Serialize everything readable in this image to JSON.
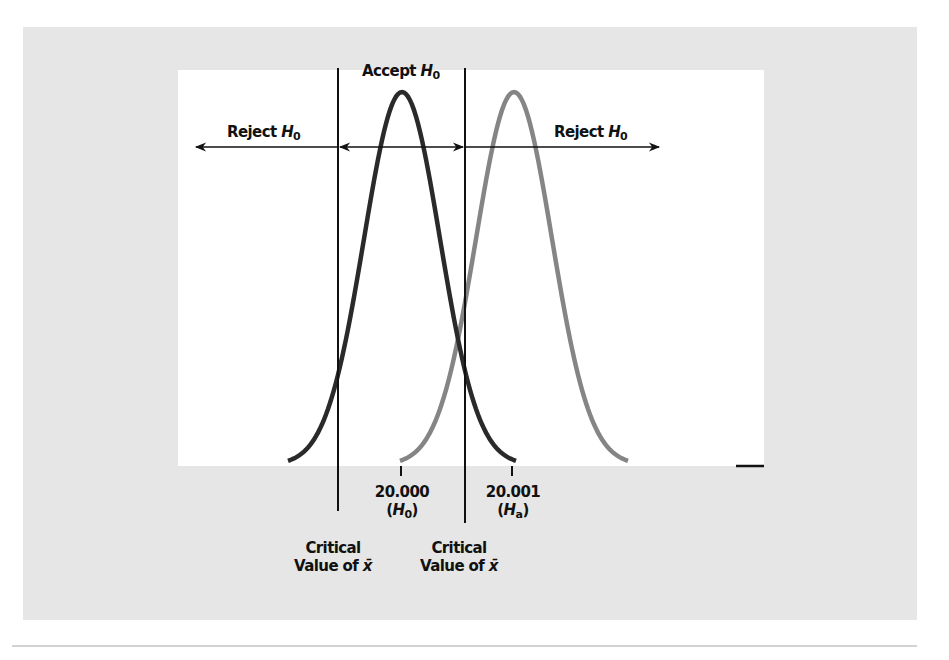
{
  "figure": {
    "labels": {
      "accept": {
        "prefix": "Accept ",
        "symbol": "H",
        "subscript": "0"
      },
      "reject_left": {
        "prefix": "Reject ",
        "symbol": "H",
        "subscript": "0"
      },
      "reject_right": {
        "prefix": "Reject ",
        "symbol": "H",
        "subscript": "0"
      }
    },
    "ticks": [
      {
        "value": "20.000",
        "hyp_symbol": "H",
        "hyp_subscript": "0"
      },
      {
        "value": "20.001",
        "hyp_symbol": "H",
        "hyp_subscript": "a"
      }
    ],
    "critical_labels": [
      {
        "line1": "Critical",
        "line2_prefix": "Value of ",
        "line2_symbol": "x̄"
      },
      {
        "line1": "Critical",
        "line2_prefix": "Value of ",
        "line2_symbol": "x̄"
      }
    ],
    "colors": {
      "background_panel": "#e6e6e6",
      "plot_area": "#ffffff",
      "h0_curve": "#2a2a2a",
      "ha_curve": "#858585",
      "lines": "#111111"
    }
  },
  "chart_data": {
    "type": "line",
    "title": "",
    "xlabel": "",
    "ylabel": "",
    "series": [
      {
        "name": "Distribution under H0",
        "mean": 20.0,
        "color": "#2a2a2a"
      },
      {
        "name": "Distribution under Ha",
        "mean": 20.001,
        "color": "#858585"
      }
    ],
    "x_ticks": [
      "20.000 (H0)",
      "20.001 (Ha)"
    ],
    "critical_values": [
      "Critical Value of x̄ (lower)",
      "Critical Value of x̄ (upper)"
    ],
    "regions": [
      "Reject H0",
      "Accept H0",
      "Reject H0"
    ],
    "grid": false,
    "legend": "none"
  }
}
